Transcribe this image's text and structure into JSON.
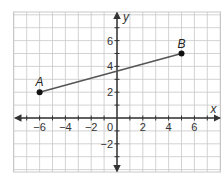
{
  "chart_data": {
    "type": "line",
    "title": "",
    "xlabel": "x",
    "ylabel": "y",
    "xlim": [
      -8,
      8
    ],
    "ylim": [
      -4,
      8
    ],
    "grid": true,
    "x_ticks": [
      -6,
      -4,
      -2,
      2,
      4,
      6
    ],
    "y_ticks": [
      -2,
      2,
      4,
      6
    ],
    "origin_label": "0",
    "points": [
      {
        "label": "A",
        "x": -6,
        "y": 2
      },
      {
        "label": "B",
        "x": 5,
        "y": 5
      }
    ],
    "segments": [
      {
        "from": "A",
        "to": "B"
      }
    ],
    "colors": {
      "grid": "#c8c8c8",
      "axis": "#333333",
      "segment": "#555555",
      "point": "#111111"
    }
  }
}
